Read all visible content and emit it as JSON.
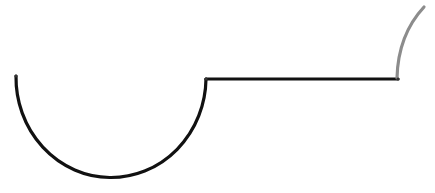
{
  "diagram": {
    "background": "#ffffff",
    "width": 435,
    "height": 193,
    "paths": [
      {
        "name": "semicircle-arc",
        "color": "#111111",
        "stroke_width": 3.2,
        "d": "M 16 76 A 95 100 0 0 0 206 79"
      },
      {
        "name": "horizontal-line",
        "color": "#111111",
        "stroke_width": 3.2,
        "d": "M 206 79 L 398 79"
      },
      {
        "name": "rising-arc",
        "color": "#8c8c8c",
        "stroke_width": 3.2,
        "d": "M 397 78 Q 398 35 424 7"
      }
    ],
    "nodes": [
      {
        "name": "start-point",
        "x": 16,
        "y": 76
      },
      {
        "name": "corner-point",
        "x": 206,
        "y": 79
      },
      {
        "name": "junction-point",
        "x": 398,
        "y": 79
      }
    ]
  }
}
